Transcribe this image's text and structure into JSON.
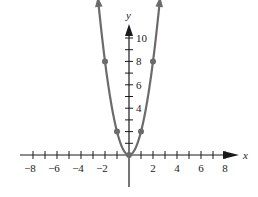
{
  "chart_data": {
    "type": "line",
    "title": "",
    "function": "y = 2x^2",
    "xlabel": "x",
    "ylabel": "y",
    "xlim": [
      -9,
      8.5
    ],
    "ylim": [
      -3,
      11
    ],
    "x_tick_labels": [
      "-8",
      "-6",
      "-4",
      "-2",
      "2",
      "4",
      "6",
      "8"
    ],
    "x_tick_values": [
      -8,
      -6,
      -4,
      -2,
      2,
      4,
      6,
      8
    ],
    "y_tick_labels": [
      "4",
      "6",
      "8",
      "10"
    ],
    "y_tick_values": [
      4,
      6,
      8,
      10
    ],
    "x_minor_ticks": [
      -8,
      -7,
      -6,
      -5,
      -4,
      -3,
      -2,
      -1,
      1,
      2,
      3,
      4,
      5,
      6,
      7,
      8
    ],
    "y_minor_ticks": [
      1,
      2,
      3,
      4,
      5,
      6,
      7,
      8,
      9,
      10
    ],
    "points": [
      {
        "x": -2,
        "y": 8
      },
      {
        "x": -1,
        "y": 2
      },
      {
        "x": 0,
        "y": 0
      },
      {
        "x": 1,
        "y": 2
      },
      {
        "x": 2,
        "y": 8
      }
    ],
    "grid": false,
    "curve_color": "#6b6b6b",
    "axis_color": "#1a1a1a"
  }
}
